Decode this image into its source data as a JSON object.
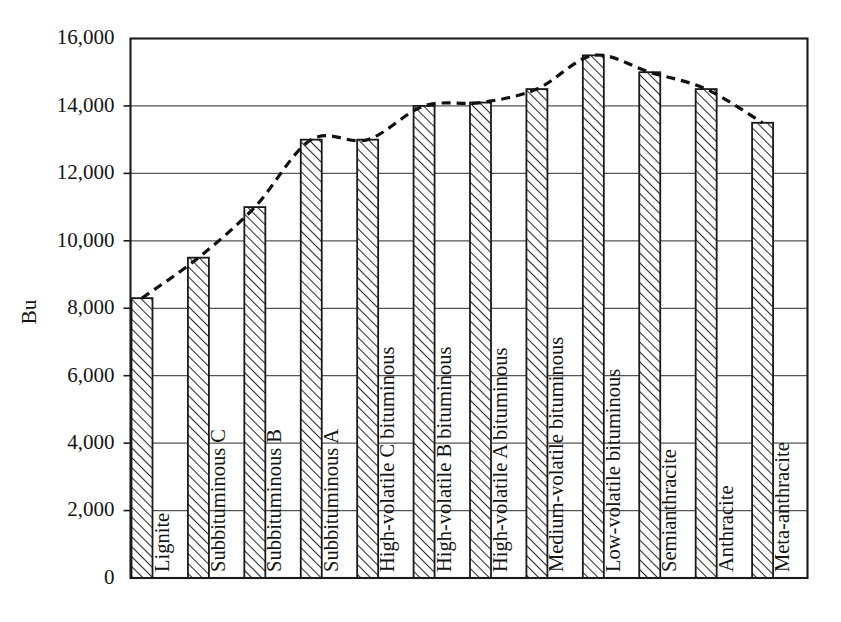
{
  "chart_data": {
    "type": "bar",
    "title": "",
    "subtitle": "",
    "xlabel": "",
    "ylabel": "Bu",
    "ylim": [
      0,
      16000
    ],
    "xlim": [
      0,
      13
    ],
    "grid": true,
    "grid_axis": "y",
    "legend": false,
    "legend_position": "none",
    "y_ticks": [
      0,
      2000,
      4000,
      6000,
      8000,
      10000,
      12000,
      14000,
      16000
    ],
    "y_tick_labels": [
      "0",
      "2,000",
      "4,000",
      "6,000",
      "8,000",
      "10,000",
      "12,000",
      "14,000",
      "16,000"
    ],
    "categories": [
      "Lignite",
      "Subbituminous C",
      "Subbituminous B",
      "Subbituminous A",
      "High-volatile C bituminous",
      "High-volatile B bituminous",
      "High-volatile A bituminous",
      "Medium-volatile bituminous",
      "Low-volatile bituminous",
      "Semianthracite",
      "Anthracite",
      "Meta-anthracite"
    ],
    "values": [
      8300,
      9500,
      11000,
      13000,
      13000,
      14000,
      14100,
      14500,
      15500,
      15000,
      14500,
      13500
    ],
    "series": [
      {
        "name": "Heating value",
        "values": [
          8300,
          9500,
          11000,
          13000,
          13000,
          14000,
          14100,
          14500,
          15500,
          15000,
          14500,
          13500
        ]
      }
    ],
    "overlay_line": {
      "style": "dashed",
      "connects": "bar_tops",
      "values": [
        8300,
        9500,
        11000,
        13000,
        13000,
        14000,
        14100,
        14500,
        15500,
        15000,
        14500,
        13500
      ]
    },
    "bar_style": {
      "fill": "hatched-diagonal",
      "edge_color": "#1a1a1a",
      "face_color": "#ffffff"
    },
    "colors": {
      "axis": "#1a1a1a",
      "grid": "#555555",
      "bar_edge": "#1a1a1a",
      "bar_hatch": "#333333",
      "line": "#111111",
      "background": "#ffffff"
    }
  },
  "axis": {
    "y_label": "Bu",
    "ticks": [
      {
        "value": 16000,
        "label": "16,000"
      },
      {
        "value": 14000,
        "label": "14,000"
      },
      {
        "value": 12000,
        "label": "12,000"
      },
      {
        "value": 10000,
        "label": "10,000"
      },
      {
        "value": 8000,
        "label": "8,000"
      },
      {
        "value": 6000,
        "label": "6,000"
      },
      {
        "value": 4000,
        "label": "4,000"
      },
      {
        "value": 2000,
        "label": "2,000"
      },
      {
        "value": 0,
        "label": "0"
      }
    ]
  },
  "bars": [
    {
      "label": "Lignite",
      "value": 8300
    },
    {
      "label": "Subbituminous C",
      "value": 9500
    },
    {
      "label": "Subbituminous B",
      "value": 11000
    },
    {
      "label": "Subbituminous A",
      "value": 13000
    },
    {
      "label": "High-volatile C bituminous",
      "value": 13000
    },
    {
      "label": "High-volatile B bituminous",
      "value": 14000
    },
    {
      "label": "High-volatile A bituminous",
      "value": 14100
    },
    {
      "label": "Medium-volatile bituminous",
      "value": 14500
    },
    {
      "label": "Low-volatile bituminous",
      "value": 15500
    },
    {
      "label": "Semianthracite",
      "value": 15000
    },
    {
      "label": "Anthracite",
      "value": 14500
    },
    {
      "label": "Meta-anthracite",
      "value": 13500
    }
  ]
}
